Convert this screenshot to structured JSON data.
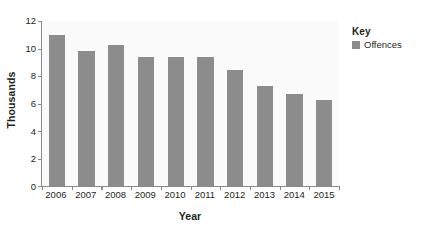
{
  "chart_data": {
    "type": "bar",
    "title": "",
    "subtitle": "",
    "categories": [
      "2006",
      "2007",
      "2008",
      "2009",
      "2010",
      "2011",
      "2012",
      "2013",
      "2014",
      "2015"
    ],
    "series": [
      {
        "name": "Offences",
        "values": [
          10.95,
          9.85,
          10.25,
          9.35,
          9.4,
          9.35,
          8.45,
          7.3,
          6.7,
          6.25
        ]
      }
    ],
    "xlabel": "Year",
    "ylabel": "Thousands",
    "ylim": [
      0,
      12
    ],
    "ytick_step": 2,
    "yticks": [
      "0",
      "2",
      "4",
      "6",
      "8",
      "10",
      "12"
    ],
    "grid": false,
    "legend_position": "top-right",
    "bar_color": "#8c8c8c",
    "plot_background": "#fafafa",
    "axis_color": "#8a8a8a",
    "text_color": "#231f20"
  },
  "legend": {
    "title": "Key",
    "entries": [
      {
        "label": "Offences",
        "color": "#8c8c8c"
      }
    ]
  }
}
